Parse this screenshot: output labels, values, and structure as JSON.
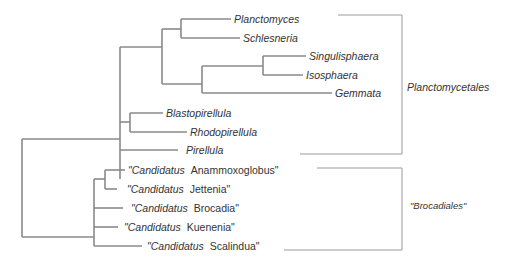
{
  "figure": {
    "type": "phylogenetic-tree",
    "line_color": "#8a8a8a",
    "bracket_color": "#9a9a9a",
    "text_color": "#333333"
  },
  "taxa": [
    {
      "id": "planctomyces",
      "genus": "Planctomyces",
      "prefix": "",
      "suffix": ""
    },
    {
      "id": "schlesneria",
      "genus": "Schlesneria",
      "prefix": "",
      "suffix": ""
    },
    {
      "id": "singulisphaera",
      "genus": "Singulisphaera",
      "prefix": "",
      "suffix": ""
    },
    {
      "id": "isosphaera",
      "genus": "Isosphaera",
      "prefix": "",
      "suffix": ""
    },
    {
      "id": "gemmata",
      "genus": "Gemmata",
      "prefix": "",
      "suffix": ""
    },
    {
      "id": "blastopirellula",
      "genus": "Blastopirellula",
      "prefix": "",
      "suffix": ""
    },
    {
      "id": "rhodopirellula",
      "genus": "Rhodopirellula",
      "prefix": "",
      "suffix": ""
    },
    {
      "id": "pirellula",
      "genus": "Pirellula",
      "prefix": "",
      "suffix": ""
    },
    {
      "id": "anammoxoglobus",
      "prefix": "\"Candidatus",
      "genus": "Anammoxoglobus\""
    },
    {
      "id": "jettenia",
      "prefix": "\"Candidatus",
      "genus": "Jettenia\""
    },
    {
      "id": "brocadia",
      "prefix": "\"Candidatus",
      "genus": "Brocadia\""
    },
    {
      "id": "kuenenia",
      "prefix": "\"Candidatus",
      "genus": "Kuenenia\""
    },
    {
      "id": "scalindua",
      "prefix": "\"Candidatus",
      "genus": "Scalindua\""
    }
  ],
  "groups": [
    {
      "id": "planctomycetales",
      "label": "Planctomycetales"
    },
    {
      "id": "brocadiales",
      "label": "\"Brocadiales\""
    }
  ]
}
